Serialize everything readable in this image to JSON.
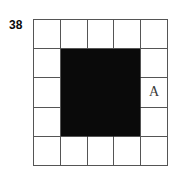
{
  "figure": {
    "problem_number": "38",
    "grid": {
      "columns": 5,
      "rows": 5,
      "line_color": "#555555",
      "fill_color": "#0a0a0a",
      "background_color": "#ffffff",
      "cells": [
        [
          {
            "fill": "white",
            "label": ""
          },
          {
            "fill": "white",
            "label": ""
          },
          {
            "fill": "white",
            "label": ""
          },
          {
            "fill": "white",
            "label": ""
          },
          {
            "fill": "white",
            "label": ""
          }
        ],
        [
          {
            "fill": "white",
            "label": ""
          },
          {
            "fill": "black",
            "label": ""
          },
          {
            "fill": "black",
            "label": ""
          },
          {
            "fill": "black",
            "label": ""
          },
          {
            "fill": "white",
            "label": ""
          }
        ],
        [
          {
            "fill": "white",
            "label": ""
          },
          {
            "fill": "black",
            "label": ""
          },
          {
            "fill": "black",
            "label": ""
          },
          {
            "fill": "black",
            "label": ""
          },
          {
            "fill": "white",
            "label": "A"
          }
        ],
        [
          {
            "fill": "white",
            "label": ""
          },
          {
            "fill": "black",
            "label": ""
          },
          {
            "fill": "black",
            "label": ""
          },
          {
            "fill": "black",
            "label": ""
          },
          {
            "fill": "white",
            "label": ""
          }
        ],
        [
          {
            "fill": "white",
            "label": ""
          },
          {
            "fill": "white",
            "label": ""
          },
          {
            "fill": "white",
            "label": ""
          },
          {
            "fill": "white",
            "label": ""
          },
          {
            "fill": "white",
            "label": ""
          }
        ]
      ]
    }
  }
}
